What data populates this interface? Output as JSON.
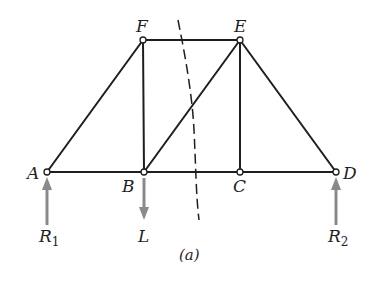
{
  "diagram": {
    "type": "truss-free-body",
    "caption": "(a)",
    "nodes": [
      {
        "id": "A",
        "label": "A",
        "x": 47,
        "y": 172
      },
      {
        "id": "B",
        "label": "B",
        "x": 144,
        "y": 172
      },
      {
        "id": "C",
        "label": "C",
        "x": 240,
        "y": 172
      },
      {
        "id": "D",
        "label": "D",
        "x": 336,
        "y": 172
      },
      {
        "id": "E",
        "label": "E",
        "x": 240,
        "y": 40
      },
      {
        "id": "F",
        "label": "F",
        "x": 143,
        "y": 40
      }
    ],
    "members": [
      "AF",
      "AB",
      "BF",
      "BE",
      "BC",
      "CE",
      "CD",
      "DE",
      "EF"
    ],
    "section_cut": "dashed line cutting members FE, BE, BC",
    "forces": [
      {
        "id": "R1",
        "label": "R",
        "subscript": "1",
        "at": "A",
        "direction": "up"
      },
      {
        "id": "L",
        "label": "L",
        "subscript": "",
        "at": "B",
        "direction": "down"
      },
      {
        "id": "R2",
        "label": "R",
        "subscript": "2",
        "at": "D",
        "direction": "up"
      }
    ],
    "colors": {
      "member": "#1e1e1e",
      "force_arrow": "#8a8a8a",
      "background": "#ffffff"
    }
  }
}
